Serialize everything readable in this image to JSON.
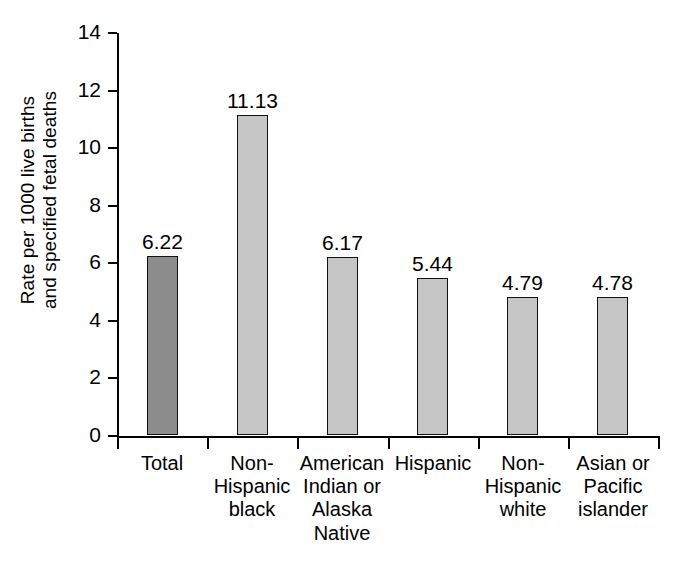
{
  "chart_data": {
    "type": "bar",
    "title": "",
    "subtitle": "",
    "xlabel": "",
    "ylabel": "Rate per 1000 live births and specified fetal deaths",
    "ylabel_lines": [
      "Rate per 1000 live births",
      "and specified fetal deaths"
    ],
    "categories": [
      "Total",
      "Non-Hispanic black",
      "American Indian or Alaska Native",
      "Hispanic",
      "Non-Hispanic white",
      "Asian or Pacific islander"
    ],
    "category_label_lines": [
      [
        "Total"
      ],
      [
        "Non-",
        "Hispanic",
        "black"
      ],
      [
        "American",
        "Indian or",
        "Alaska",
        "Native"
      ],
      [
        "Hispanic"
      ],
      [
        "Non-",
        "Hispanic",
        "white"
      ],
      [
        "Asian or",
        "Pacific",
        "islander"
      ]
    ],
    "values": [
      6.22,
      11.13,
      6.17,
      5.44,
      4.79,
      4.78
    ],
    "value_labels": [
      "6.22",
      "11.13",
      "6.17",
      "5.44",
      "4.79",
      "4.78"
    ],
    "bar_colors": [
      "#8d8d8d",
      "#c6c6c6",
      "#c6c6c6",
      "#c6c6c6",
      "#c6c6c6",
      "#c6c6c6"
    ],
    "bar_border_color": "#111111",
    "ylim": [
      0,
      14
    ],
    "ytick_values": [
      0,
      2,
      4,
      6,
      8,
      10,
      12,
      14
    ],
    "ytick_labels": [
      "0",
      "2",
      "4",
      "6",
      "8",
      "10",
      "12",
      "14"
    ],
    "grid": false,
    "legend": null,
    "legend_position": "none",
    "background_color": "#ffffff",
    "axis_color": "#000000"
  }
}
